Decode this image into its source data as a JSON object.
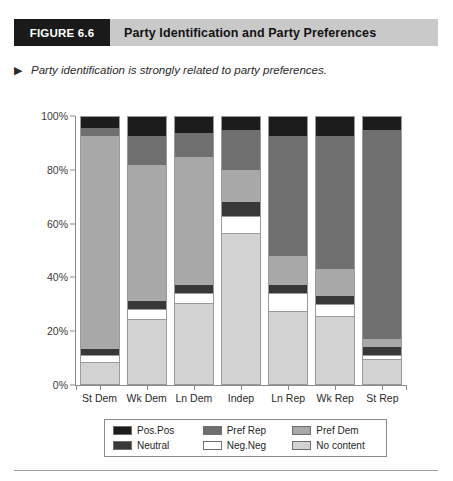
{
  "figure": {
    "tag": "FIGURE 6.6",
    "title": "Party Identification and Party Preferences",
    "caption": "Party identification is strongly related to party preferences.",
    "caption_bullet": "▶"
  },
  "colors": {
    "pos_pos": "#1c1c1c",
    "neutral": "#383838",
    "pref_rep": "#6f6f6f",
    "neg_neg": "#ffffff",
    "pref_dem": "#a8a8a8",
    "no_content": "#d2d2d2",
    "banner_bg": "#c9c9c9",
    "tag_bg": "#1a1a1a",
    "axis": "#8a8a8a",
    "bar_border": "#9a9a9a"
  },
  "legend": {
    "items": [
      {
        "key": "pos_pos",
        "label": "Pos.Pos",
        "color": "#1c1c1c"
      },
      {
        "key": "pref_rep",
        "label": "Pref Rep",
        "color": "#6f6f6f"
      },
      {
        "key": "pref_dem",
        "label": "Pref Dem",
        "color": "#a8a8a8"
      },
      {
        "key": "neutral",
        "label": "Neutral",
        "color": "#383838"
      },
      {
        "key": "neg_neg",
        "label": "Neg.Neg",
        "color": "#ffffff"
      },
      {
        "key": "no_content",
        "label": "No content",
        "color": "#d2d2d2"
      }
    ]
  },
  "chart_data": {
    "type": "bar",
    "stacked": true,
    "stack_total": 100,
    "title": "Party Identification and Party Preferences",
    "xlabel": "",
    "ylabel": "",
    "ylim": [
      0,
      100
    ],
    "yticks": [
      0,
      20,
      40,
      60,
      80,
      100
    ],
    "ytick_labels": [
      "0%",
      "20%",
      "40%",
      "60%",
      "80%",
      "100%"
    ],
    "grid": false,
    "legend_position": "bottom",
    "categories": [
      "St Dem",
      "Wk Dem",
      "Ln Dem",
      "Indep",
      "Ln Rep",
      "Wk Rep",
      "St Rep"
    ],
    "series": [
      {
        "name": "No content",
        "key": "no_content",
        "color": "#d2d2d2",
        "values": [
          8,
          24,
          30,
          56,
          27,
          25,
          9
        ]
      },
      {
        "name": "Neg.Neg",
        "key": "neg_neg",
        "color": "#ffffff",
        "values": [
          3,
          4,
          4,
          7,
          7,
          5,
          2
        ]
      },
      {
        "name": "Neutral",
        "key": "neutral",
        "color": "#383838",
        "values": [
          2,
          3,
          3,
          5,
          3,
          3,
          3
        ]
      },
      {
        "name": "Pref Dem",
        "key": "pref_dem",
        "color": "#a8a8a8",
        "values": [
          80,
          51,
          48,
          12,
          11,
          10,
          3
        ]
      },
      {
        "name": "Pref Rep",
        "key": "pref_rep",
        "color": "#6f6f6f",
        "values": [
          3,
          11,
          9,
          15,
          45,
          50,
          78
        ]
      },
      {
        "name": "Pos.Pos",
        "key": "pos_pos",
        "color": "#1c1c1c",
        "values": [
          4,
          7,
          6,
          5,
          7,
          7,
          5
        ]
      }
    ]
  }
}
